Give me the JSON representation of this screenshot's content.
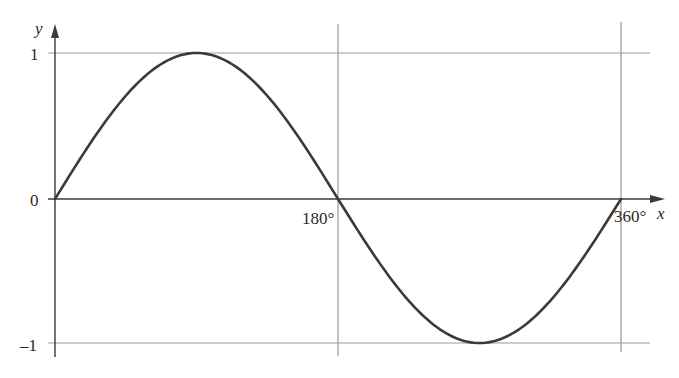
{
  "chart_data": {
    "type": "line",
    "title": "",
    "xlabel": "x",
    "ylabel": "y",
    "series": [
      {
        "name": "y = sin x",
        "x": [
          0,
          30,
          60,
          90,
          120,
          150,
          180,
          210,
          240,
          270,
          300,
          330,
          360
        ],
        "values": [
          0,
          0.5,
          0.866,
          1,
          0.866,
          0.5,
          0,
          -0.5,
          -0.866,
          -1,
          -0.866,
          -0.5,
          0
        ]
      }
    ],
    "x_ticks": [
      {
        "value": 180,
        "label": "180°"
      },
      {
        "value": 360,
        "label": "360°"
      }
    ],
    "y_ticks": [
      {
        "value": 1,
        "label": "1"
      },
      {
        "value": 0,
        "label": "0"
      },
      {
        "value": -1,
        "label": "–1"
      }
    ],
    "xlim": [
      0,
      360
    ],
    "ylim": [
      -1,
      1
    ],
    "grid": true,
    "legend": "none"
  },
  "colors": {
    "curve": "#3a3a3a",
    "axis": "#3a3a3a",
    "grid": "#9a9a9a",
    "text": "#2a2a2a"
  }
}
